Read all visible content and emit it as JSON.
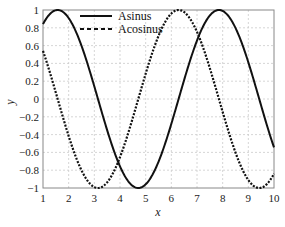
{
  "chart_data": {
    "type": "line",
    "title": "",
    "xlabel": "x",
    "ylabel": "y",
    "xlim": [
      1,
      10
    ],
    "ylim": [
      -1,
      1
    ],
    "grid": true,
    "legend_position": "upper center",
    "x_ticks": [
      "1",
      "2",
      "3",
      "4",
      "5",
      "6",
      "7",
      "8",
      "9",
      "10"
    ],
    "y_ticks": [
      "1",
      "0.8",
      "0.6",
      "0.4",
      "0.2",
      "0",
      "-0.2",
      "-0.4",
      "-0.6",
      "-0.8",
      "-1"
    ],
    "series": [
      {
        "name": "Asinus",
        "style": "solid",
        "color": "#111111",
        "function": "sin(x)",
        "x": [
          1,
          1.5,
          2,
          2.5,
          3,
          3.5,
          4,
          4.5,
          5,
          5.5,
          6,
          6.5,
          7,
          7.5,
          8,
          8.5,
          9,
          9.5,
          10
        ],
        "values": [
          0.84,
          1.0,
          0.91,
          0.6,
          0.14,
          -0.35,
          -0.76,
          -0.98,
          -0.96,
          -0.71,
          -0.28,
          0.22,
          0.66,
          0.94,
          0.99,
          0.8,
          0.41,
          -0.08,
          -0.54
        ]
      },
      {
        "name": "Acosinus",
        "style": "dotted",
        "color": "#111111",
        "function": "cos(x)",
        "x": [
          1,
          1.5,
          2,
          2.5,
          3,
          3.5,
          4,
          4.5,
          5,
          5.5,
          6,
          6.5,
          7,
          7.5,
          8,
          8.5,
          9,
          9.5,
          10
        ],
        "values": [
          0.54,
          0.07,
          -0.42,
          -0.8,
          -0.99,
          -0.94,
          -0.65,
          -0.21,
          0.28,
          0.71,
          0.96,
          0.98,
          0.75,
          0.35,
          -0.15,
          -0.6,
          -0.91,
          -1.0,
          -0.84
        ]
      }
    ]
  },
  "legend": {
    "items": [
      {
        "label": "Asinus"
      },
      {
        "label": "Acosinus"
      }
    ]
  },
  "axes": {
    "xlabel": "x",
    "ylabel": "y"
  }
}
